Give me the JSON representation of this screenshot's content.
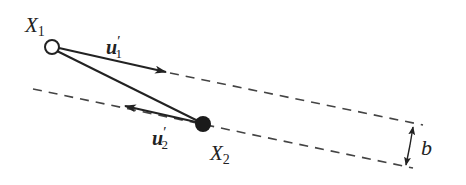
{
  "diagram": {
    "colors": {
      "stroke": "#222222",
      "dash": "#444444",
      "open_fill": "#ffffff",
      "filled": "#1a1a1a"
    },
    "labels": {
      "x1_main": "X",
      "x1_sub": "1",
      "x2_main": "X",
      "x2_sub": "2",
      "u1_main": "u",
      "u1_prime": "′",
      "u1_sub": "1",
      "u2_main": "u",
      "u2_prime": "′",
      "u2_sub": "2",
      "b": "b"
    },
    "points": {
      "X1": {
        "x": 52,
        "y": 47,
        "style": "open"
      },
      "X2": {
        "x": 203,
        "y": 124,
        "style": "filled"
      }
    }
  }
}
